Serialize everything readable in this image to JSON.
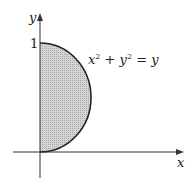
{
  "diagram": {
    "axes": {
      "x_label": "x",
      "y_label": "y"
    },
    "ticks": {
      "y_tick_1": "1"
    },
    "curve_label": {
      "base1": "x",
      "exp1": "2",
      "plus": " + ",
      "base2": "y",
      "exp2": "2",
      "eq": " = ",
      "rhs": "y"
    },
    "region": {
      "description": "right half of disk x^2 + y^2 = y, shaded",
      "fill": "#c8c8c8",
      "stroke": "#222222"
    }
  }
}
